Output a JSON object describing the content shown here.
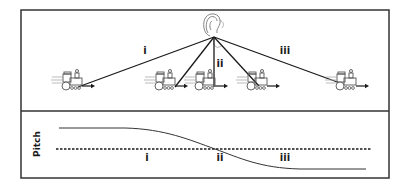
{
  "diagram": {
    "topic": "Doppler effect: pitch heard as a train passes a listener",
    "listener": {
      "icon": "ear-icon",
      "x": 214,
      "y": 37
    },
    "top_panel": {
      "rays": [
        {
          "id": "ray-1",
          "label": "i",
          "to": [
            78,
            87
          ]
        },
        {
          "id": "ray-2",
          "label": "",
          "to": [
            175,
            87
          ]
        },
        {
          "id": "ray-3",
          "label": "ii",
          "to": [
            214,
            87
          ]
        },
        {
          "id": "ray-4",
          "label": "",
          "to": [
            259,
            86
          ]
        },
        {
          "id": "ray-5",
          "label": "iii",
          "to": [
            340,
            83
          ]
        }
      ],
      "labels": [
        {
          "text": "i",
          "x": 145,
          "y": 46
        },
        {
          "text": "ii",
          "x": 219,
          "y": 59
        },
        {
          "text": "iii",
          "x": 285,
          "y": 46
        }
      ],
      "trains": [
        {
          "x": 60,
          "y": 70
        },
        {
          "x": 153,
          "y": 70
        },
        {
          "x": 193,
          "y": 70
        },
        {
          "x": 245,
          "y": 70
        },
        {
          "x": 334,
          "y": 70
        }
      ],
      "train_icon": "train-icon",
      "direction": "left-to-right"
    },
    "bottom_panel": {
      "axis_label": "Pitch",
      "baseline_style": "dashed",
      "curve": "high-flat then falling through baseline at ii then low-flat",
      "labels": [
        {
          "text": "i",
          "x": 147,
          "y": 153
        },
        {
          "text": "ii",
          "x": 220,
          "y": 153
        },
        {
          "text": "iii",
          "x": 285,
          "y": 153
        }
      ]
    },
    "colors": {
      "line": "#1a1a1a",
      "frame": "#333333",
      "icon": "#555555",
      "background": "#ffffff"
    }
  }
}
